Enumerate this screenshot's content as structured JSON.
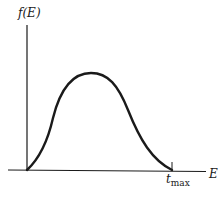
{
  "diagram": {
    "y_axis_label": "f(E)",
    "x_axis_label": "E",
    "x_marker_label": {
      "base": "t",
      "sub": "max"
    },
    "colors": {
      "ink": "#1a1a1a",
      "background": "#ffffff"
    }
  }
}
